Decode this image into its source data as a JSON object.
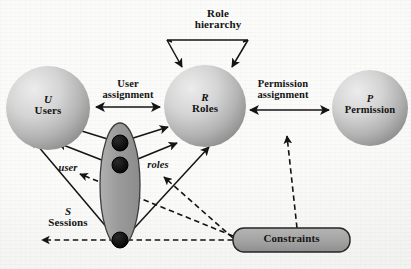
{
  "diagram": {
    "background_color": "#fbfbfa",
    "nodes": {
      "users": {
        "symbol": "U",
        "label": "Users",
        "shape": "sphere",
        "cx": 48,
        "cy": 108,
        "r": 42,
        "fill_light": "#e6e6e6",
        "fill_dark": "#9e9e9e"
      },
      "roles": {
        "symbol": "R",
        "label": "Roles",
        "shape": "sphere",
        "cx": 205,
        "cy": 106,
        "r": 41,
        "fill_light": "#e6e6e6",
        "fill_dark": "#9e9e9e"
      },
      "permission": {
        "symbol": "P",
        "label": "Permission",
        "shape": "sphere",
        "cx": 370,
        "cy": 108,
        "r": 38,
        "fill_light": "#e6e6e6",
        "fill_dark": "#9e9e9e"
      },
      "sessions": {
        "symbol": "S",
        "label": "Sessions",
        "shape": "ellipse",
        "cx": 120,
        "cy": 185,
        "rx": 20,
        "ry": 62,
        "fill": "#9a9a9a",
        "stroke": "#3a3a3a",
        "dots": [
          {
            "cx": 120,
            "cy": 143,
            "r": 8
          },
          {
            "cx": 120,
            "cy": 165,
            "r": 8
          },
          {
            "cx": 120,
            "cy": 240,
            "r": 8
          }
        ],
        "dot_fill": "#0d0d0d"
      },
      "constraints": {
        "label": "Constraints",
        "shape": "rounded-rect",
        "x": 233,
        "y": 228,
        "w": 117,
        "h": 24,
        "fill": "#a2a2a2",
        "stroke": "#2a2a2a"
      }
    },
    "edge_labels": {
      "role_hierarchy_line1": "Role",
      "role_hierarchy_line2": "hierarchy",
      "user_assignment_line1": "User",
      "user_assignment_line2": "assignment",
      "permission_assignment_line1": "Permission",
      "permission_assignment_line2": "assignment",
      "user_mapping": "user",
      "roles_mapping": "roles"
    },
    "edges": [
      {
        "name": "user-assignment",
        "from": "users",
        "to": "roles",
        "style": "solid",
        "arrows": "both"
      },
      {
        "name": "permission-assignment",
        "from": "roles",
        "to": "permission",
        "style": "solid",
        "arrows": "both"
      },
      {
        "name": "role-hierarchy",
        "from": "roles",
        "to": "roles",
        "style": "solid",
        "arrows": "both",
        "shape": "trapezoid-loop"
      },
      {
        "name": "session-user-1",
        "from": "sessions",
        "to": "users",
        "style": "solid",
        "arrows": "to"
      },
      {
        "name": "session-user-2",
        "from": "sessions",
        "to": "users",
        "style": "solid",
        "arrows": "to"
      },
      {
        "name": "session-user-3",
        "from": "sessions",
        "to": "users",
        "style": "solid",
        "arrows": "to"
      },
      {
        "name": "session-roles-1",
        "from": "sessions",
        "to": "roles",
        "style": "solid",
        "arrows": "to"
      },
      {
        "name": "session-roles-2",
        "from": "sessions",
        "to": "roles",
        "style": "solid",
        "arrows": "to"
      },
      {
        "name": "session-roles-3",
        "from": "sessions",
        "to": "roles",
        "style": "solid",
        "arrows": "to"
      },
      {
        "name": "constraint-user",
        "from": "constraints",
        "to": "user-mapping",
        "style": "dashed",
        "arrows": "to"
      },
      {
        "name": "constraint-roles",
        "from": "constraints",
        "to": "roles-mapping",
        "style": "dashed",
        "arrows": "to"
      },
      {
        "name": "constraint-sessions",
        "from": "constraints",
        "to": "sessions",
        "style": "dashed",
        "arrows": "to"
      },
      {
        "name": "constraint-permission-assignment",
        "from": "constraints",
        "to": "permission-assignment",
        "style": "dashed",
        "arrows": "to"
      }
    ],
    "colors": {
      "stroke": "#141414",
      "sphere_light": "#e8e8e8",
      "sphere_dark": "#9c9c9c",
      "session_fill": "#9a9a9a",
      "constraint_fill": "#a2a2a2"
    }
  }
}
